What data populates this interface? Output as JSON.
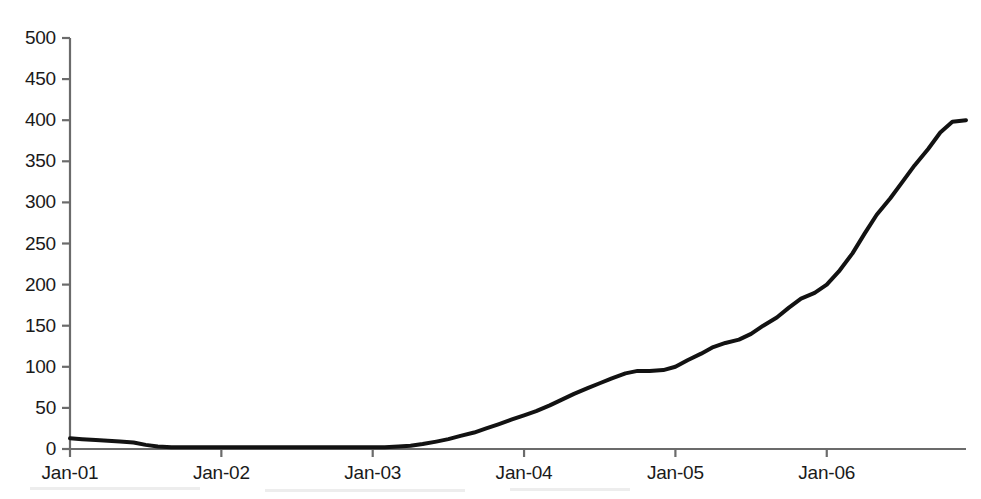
{
  "figure": {
    "background_color": "#ffffff",
    "line_color": "#121212",
    "axis_color": "#6b6b6b",
    "text_color": "#1a1a1a"
  },
  "chart_data": {
    "type": "line",
    "title": "",
    "subtitle": "",
    "xlabel": "",
    "ylabel": "",
    "grid": false,
    "legend": "none",
    "xlim": [
      2001.0,
      2006.92
    ],
    "ylim": [
      0,
      500
    ],
    "yticks": [
      0,
      50,
      100,
      150,
      200,
      250,
      300,
      350,
      400,
      450,
      500
    ],
    "ytick_labels": [
      "0",
      "50",
      "100",
      "150",
      "200",
      "250",
      "300",
      "350",
      "400",
      "450",
      "500"
    ],
    "xticks": [
      2001.0,
      2002.0,
      2003.0,
      2004.0,
      2005.0,
      2006.0
    ],
    "xtick_labels": [
      "Jan-01",
      "Jan-02",
      "Jan-03",
      "Jan-04",
      "Jan-05",
      "Jan-06"
    ],
    "series": [
      {
        "name": "series-1",
        "color": "#121212",
        "line_width": 4,
        "x": [
          2001.0,
          2001.08,
          2001.17,
          2001.25,
          2001.33,
          2001.42,
          2001.5,
          2001.58,
          2001.67,
          2001.75,
          2001.83,
          2001.92,
          2002.0,
          2002.08,
          2002.17,
          2002.25,
          2002.33,
          2002.42,
          2002.5,
          2002.58,
          2002.67,
          2002.75,
          2002.83,
          2002.92,
          2003.0,
          2003.08,
          2003.17,
          2003.25,
          2003.33,
          2003.42,
          2003.5,
          2003.58,
          2003.67,
          2003.75,
          2003.83,
          2003.92,
          2004.0,
          2004.08,
          2004.17,
          2004.25,
          2004.33,
          2004.42,
          2004.5,
          2004.58,
          2004.67,
          2004.75,
          2004.83,
          2004.92,
          2005.0,
          2005.08,
          2005.17,
          2005.25,
          2005.33,
          2005.42,
          2005.5,
          2005.58,
          2005.67,
          2005.75,
          2005.83,
          2005.92,
          2006.0,
          2006.08,
          2006.17,
          2006.25,
          2006.33,
          2006.42,
          2006.5,
          2006.58,
          2006.67,
          2006.75,
          2006.83,
          2006.92
        ],
        "y": [
          13,
          12,
          11,
          10,
          9,
          8,
          5,
          3,
          2,
          2,
          2,
          2,
          2,
          2,
          2,
          2,
          2,
          2,
          2,
          2,
          2,
          2,
          2,
          2,
          2,
          2,
          3,
          4,
          6,
          9,
          12,
          16,
          20,
          25,
          30,
          36,
          41,
          46,
          53,
          60,
          67,
          74,
          80,
          86,
          92,
          95,
          95,
          96,
          100,
          108,
          116,
          124,
          129,
          133,
          140,
          150,
          160,
          172,
          183,
          190,
          200,
          216,
          238,
          262,
          285,
          305,
          325,
          345,
          365,
          385,
          398,
          400
        ]
      }
    ],
    "annotations": []
  },
  "axes": {
    "y_axis_line": true,
    "x_axis_line": true,
    "tick_direction": "out"
  }
}
